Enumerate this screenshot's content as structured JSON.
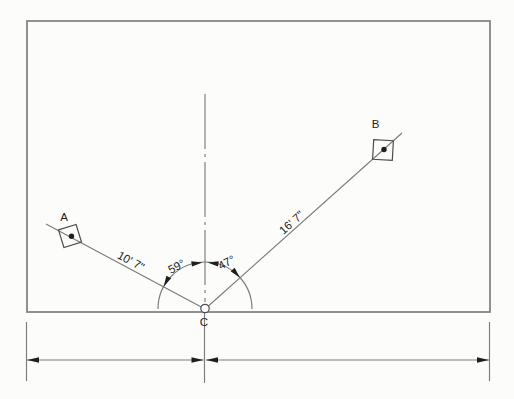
{
  "diagram": {
    "colors": {
      "bg": "#fcfcfb",
      "line": "#7c7c7c",
      "line-strong": "#868686",
      "ink": "#1f1f1f"
    },
    "points": {
      "a": {
        "label": "A"
      },
      "b": {
        "label": "B"
      },
      "c": {
        "label": "C"
      }
    },
    "distances": {
      "c_to_a": "10' 7\"",
      "c_to_b": "16' 7\""
    },
    "angles": {
      "ca_to_centerline": "59°",
      "centerline_to_cb": "47°"
    }
  }
}
